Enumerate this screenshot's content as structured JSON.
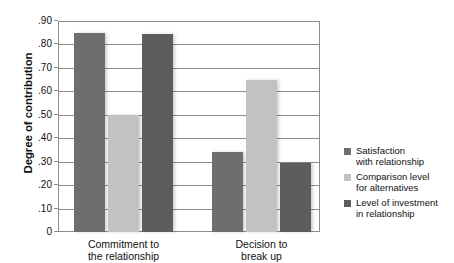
{
  "chart_data": {
    "type": "bar",
    "title": "",
    "xlabel": "",
    "ylabel": "Degree of contribution",
    "ylim": [
      0,
      0.9
    ],
    "grid": true,
    "legend_position": "right",
    "categories": [
      "Commitment to the relationship",
      "Decision to break up"
    ],
    "category_lines": [
      [
        "Commitment to",
        "the relationship"
      ],
      [
        "Decision to",
        "break up"
      ]
    ],
    "ytick_labels": [
      "0",
      ".10",
      ".20",
      ".30",
      ".40",
      ".50",
      ".60",
      ".70",
      ".80",
      ".90"
    ],
    "ytick_values": [
      0,
      0.1,
      0.2,
      0.3,
      0.4,
      0.5,
      0.6,
      0.7,
      0.8,
      0.9
    ],
    "series": [
      {
        "name": "Satisfaction with relationship",
        "name_lines": [
          "Satisfaction",
          "with relationship"
        ],
        "color": "#6e6e6e",
        "values": [
          0.85,
          0.34
        ]
      },
      {
        "name": "Comparison level for alternatives",
        "name_lines": [
          "Comparison level",
          "for alternatives"
        ],
        "color": "#c2c2c2",
        "values": [
          0.5,
          0.65
        ]
      },
      {
        "name": "Level of investment in relationship",
        "name_lines": [
          "Level of investment",
          "in relationship"
        ],
        "color": "#5d5d5d",
        "values": [
          0.845,
          0.295
        ]
      }
    ]
  }
}
